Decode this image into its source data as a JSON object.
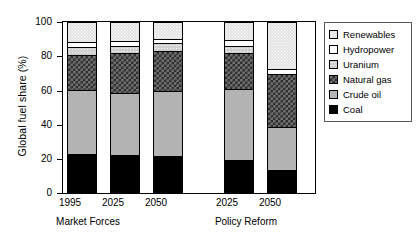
{
  "chart_data": {
    "type": "bar",
    "title": "",
    "subtype": "stacked-percentage-column",
    "xlabel": "",
    "ylabel": "Global fuel share (%)",
    "ylim": [
      0,
      100
    ],
    "yticks": [
      0,
      20,
      40,
      60,
      80,
      100
    ],
    "ytick_labels": [
      "0",
      "20",
      "40",
      "60",
      "80",
      "100"
    ],
    "grid": false,
    "legend_position": "right",
    "categories": [
      "1995",
      "2025",
      "2050",
      "2025",
      "2050"
    ],
    "groups": [
      {
        "label": "Market Forces",
        "categories": [
          "1995",
          "2025",
          "2050"
        ]
      },
      {
        "label": "Policy Reform",
        "categories": [
          "2025",
          "2050"
        ]
      }
    ],
    "series": [
      {
        "name": "Coal",
        "color": "#000000",
        "pattern": "solid-black",
        "values": [
          22.5,
          22.0,
          21.5,
          19.0,
          13.0
        ]
      },
      {
        "name": "Crude oil",
        "color": "#b3b3b3",
        "pattern": "solid-gray",
        "values": [
          38.0,
          36.5,
          38.5,
          42.0,
          25.5
        ]
      },
      {
        "name": "Natural gas",
        "color": "#6e6e6e",
        "pattern": "checkerboard",
        "values": [
          20.5,
          24.0,
          23.5,
          21.0,
          31.5
        ]
      },
      {
        "name": "Uranium",
        "color": "#d0d0d0",
        "pattern": "fine-dots",
        "values": [
          5.0,
          4.0,
          4.5,
          4.5,
          0.0
        ]
      },
      {
        "name": "Hydropower",
        "color": "#ffffff",
        "pattern": "white",
        "values": [
          3.0,
          3.0,
          2.5,
          3.5,
          3.0
        ]
      },
      {
        "name": "Renewables",
        "color": "#e3e3e3",
        "pattern": "sparse-dots",
        "values": [
          11.0,
          10.5,
          9.5,
          10.0,
          27.0
        ]
      }
    ],
    "legend_entries": [
      "Renewables",
      "Hydropower",
      "Uranium",
      "Natural gas",
      "Crude oil",
      "Coal"
    ]
  },
  "axis": {
    "y_title": "Global fuel share (%)",
    "y_labels": [
      "100",
      "80",
      "60",
      "40",
      "20",
      "0"
    ]
  },
  "x_axis": {
    "tick_labels": [
      "1995",
      "2025",
      "2050",
      "2025",
      "2050"
    ],
    "group_labels": [
      "Market Forces",
      "Policy Reform"
    ]
  },
  "legend": {
    "items": [
      {
        "label": "Renewables",
        "swatch": "renewables-swatch"
      },
      {
        "label": "Hydropower",
        "swatch": "hydropower-swatch"
      },
      {
        "label": "Uranium",
        "swatch": "uranium-swatch"
      },
      {
        "label": "Natural gas",
        "swatch": "natural-gas-swatch"
      },
      {
        "label": "Crude oil",
        "swatch": "crude-oil-swatch"
      },
      {
        "label": "Coal",
        "swatch": "coal-swatch"
      }
    ]
  }
}
